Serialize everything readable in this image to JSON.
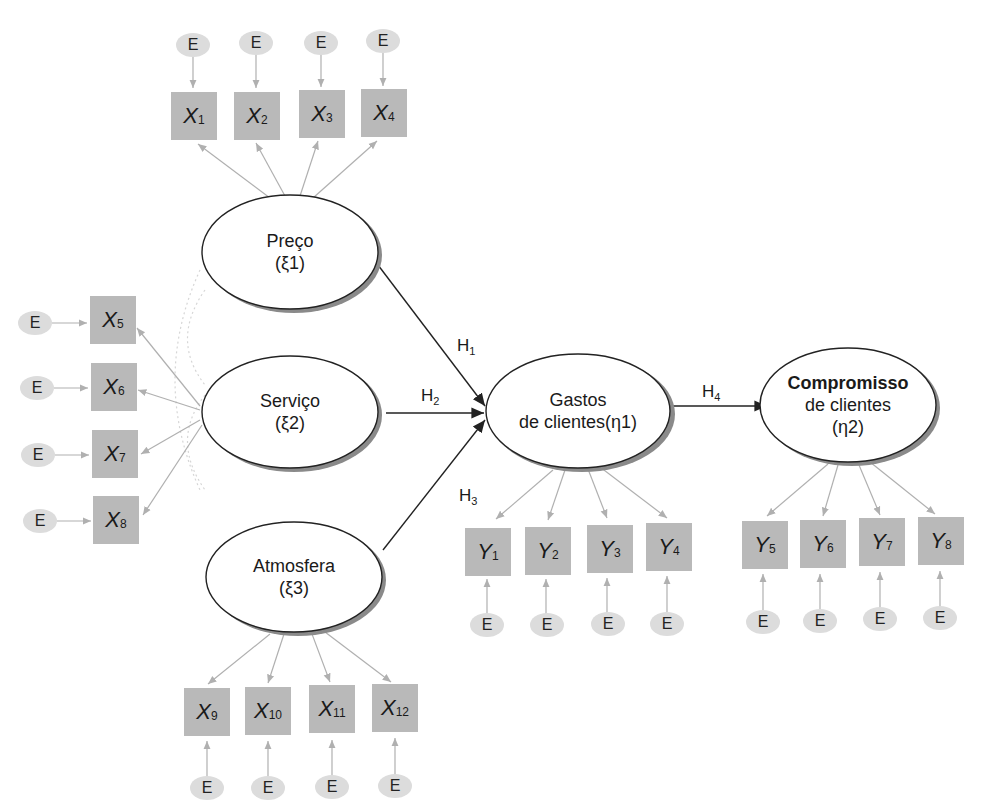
{
  "diagram": {
    "type": "structural_equation_model",
    "error_label": "E",
    "latent_constructs": [
      {
        "id": "xi1",
        "name": "Preço",
        "symbol": "(ξ1)",
        "indicators": [
          "X1",
          "X2",
          "X3",
          "X4"
        ]
      },
      {
        "id": "xi2",
        "name": "Serviço",
        "symbol": "(ξ2)",
        "indicators": [
          "X5",
          "X6",
          "X7",
          "X8"
        ]
      },
      {
        "id": "xi3",
        "name": "Atmosfera",
        "symbol": "(ξ3)",
        "indicators": [
          "X9",
          "X10",
          "X11",
          "X12"
        ]
      },
      {
        "id": "eta1",
        "name_line1": "Gastos",
        "name_line2": "de clientes(η1)",
        "indicators": [
          "Y1",
          "Y2",
          "Y3",
          "Y4"
        ]
      },
      {
        "id": "eta2",
        "name_line1": "Compromisso",
        "name_line2": "de clientes",
        "symbol": "(η2)",
        "indicators": [
          "Y5",
          "Y6",
          "Y7",
          "Y8"
        ]
      }
    ],
    "hypotheses": [
      {
        "label": "H",
        "sub": "1",
        "from": "Preço",
        "to": "Gastos de clientes"
      },
      {
        "label": "H",
        "sub": "2",
        "from": "Serviço",
        "to": "Gastos de clientes"
      },
      {
        "label": "H",
        "sub": "3",
        "from": "Atmosfera",
        "to": "Gastos de clientes"
      },
      {
        "label": "H",
        "sub": "4",
        "from": "Gastos de clientes",
        "to": "Compromisso de clientes"
      }
    ],
    "indicators": {
      "x": [
        {
          "var": "X",
          "sub": "1"
        },
        {
          "var": "X",
          "sub": "2"
        },
        {
          "var": "X",
          "sub": "3"
        },
        {
          "var": "X",
          "sub": "4"
        },
        {
          "var": "X",
          "sub": "5"
        },
        {
          "var": "X",
          "sub": "6"
        },
        {
          "var": "X",
          "sub": "7"
        },
        {
          "var": "X",
          "sub": "8"
        },
        {
          "var": "X",
          "sub": "9"
        },
        {
          "var": "X",
          "sub": "10"
        },
        {
          "var": "X",
          "sub": "11"
        },
        {
          "var": "X",
          "sub": "12"
        }
      ],
      "y": [
        {
          "var": "Y",
          "sub": "1"
        },
        {
          "var": "Y",
          "sub": "2"
        },
        {
          "var": "Y",
          "sub": "3"
        },
        {
          "var": "Y",
          "sub": "4"
        },
        {
          "var": "Y",
          "sub": "5"
        },
        {
          "var": "Y",
          "sub": "6"
        },
        {
          "var": "Y",
          "sub": "7"
        },
        {
          "var": "Y",
          "sub": "8"
        }
      ]
    },
    "colors": {
      "indicator_box": "#b9b9b9",
      "error_ellipse": "#dcdcdc",
      "measurement_arrow": "#b0b0b0",
      "structural_arrow": "#222222",
      "ellipse_shadow": "#8a8a8a"
    }
  }
}
